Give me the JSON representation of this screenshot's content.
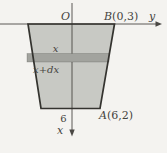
{
  "colors": {
    "background": "#f4f3f0",
    "tank_fill": "#c8c9c4",
    "strip_fill": "#a2a39e",
    "outline": "#34332f",
    "axis": "#4a4844",
    "ink": "#454340"
  },
  "labels": {
    "origin": "O",
    "y_axis": "y",
    "x_axis": "x",
    "upper_depth": "x",
    "lower_depth": "x+dx",
    "bottom_tick": "6",
    "point_b": {
      "name": "B",
      "coords": "(0,3)"
    },
    "point_a": {
      "name": "A",
      "coords": "(6,2)"
    }
  }
}
